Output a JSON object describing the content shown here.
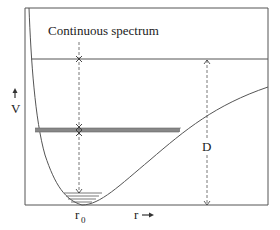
{
  "diagram": {
    "labels": {
      "continuous_spectrum": "Continuous spectrum",
      "y_axis": "V",
      "x_axis": "r",
      "equilibrium": "r",
      "equilibrium_sub": "0",
      "dissociation": "D"
    },
    "colors": {
      "line": "#555555",
      "band": "#888888",
      "text": "#222222"
    }
  }
}
